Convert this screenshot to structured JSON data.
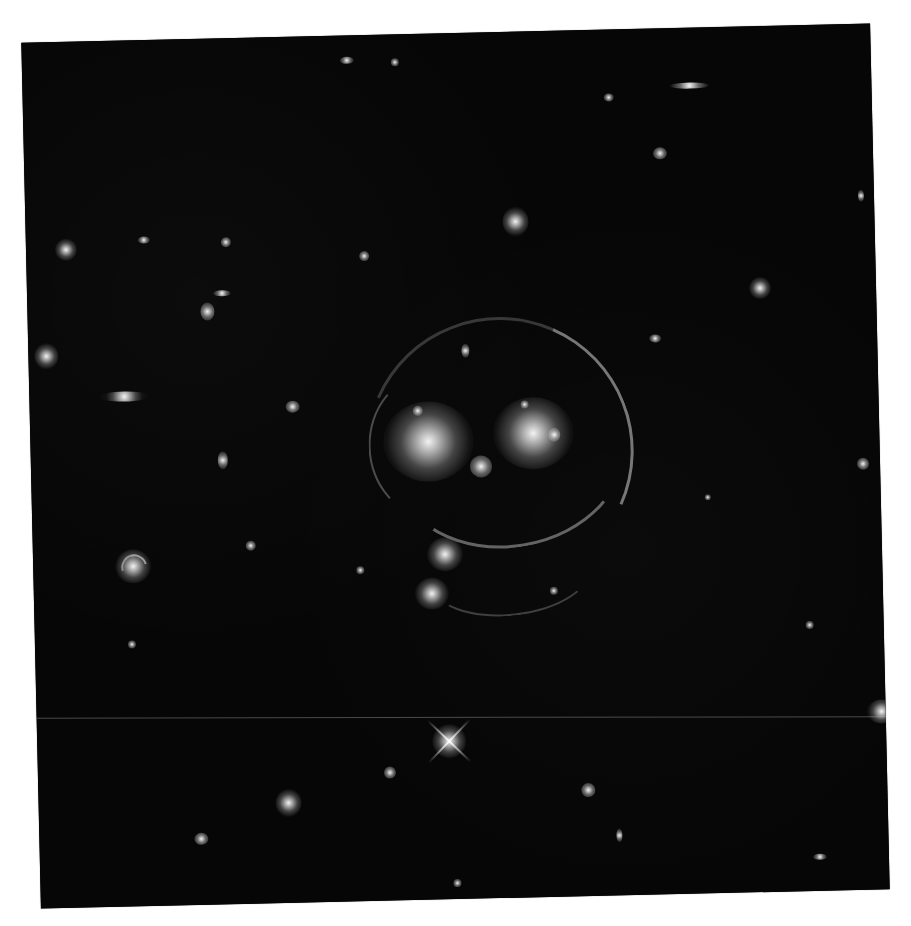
{
  "image": {
    "subject": "galaxy cluster gravitational lens (smiley face)",
    "background_color": "#050505",
    "page_color": "#ffffff",
    "rotation_deg": -1.3,
    "frame": {
      "left": 31,
      "top": 33,
      "width": 849,
      "height": 866
    }
  },
  "features": {
    "lens_center_galaxies": [
      {
        "name": "left-eye-galaxy",
        "x": 398,
        "y": 408,
        "size": 70
      },
      {
        "name": "right-eye-galaxy",
        "x": 502,
        "y": 400,
        "size": 62
      },
      {
        "name": "nose-galaxy",
        "x": 450,
        "y": 432,
        "size": 26
      }
    ],
    "einstein_ring": {
      "cx": 470,
      "cy": 430,
      "radius": 125
    },
    "bright_star": {
      "x": 412,
      "y": 708
    },
    "spiral_galaxy": {
      "x": 100,
      "y": 526
    }
  },
  "caption": {
    "text": ""
  }
}
